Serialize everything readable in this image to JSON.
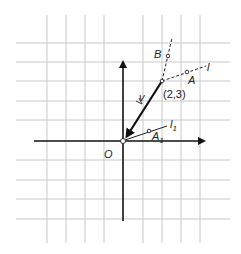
{
  "diagram": {
    "title": "",
    "labels": {
      "origin": "O",
      "point_23": "(2,3)",
      "point_B": "B",
      "point_A": "A",
      "line_l": "l",
      "line_l1_main": "l",
      "line_l1_sub": "1",
      "point_A1_main": "A",
      "point_A1_sub": "1",
      "vector_v": "v"
    },
    "grid": {
      "unit_px": 19.5,
      "origin_px": [
        123,
        141
      ],
      "x_lines_px": [
        47,
        66,
        85,
        104,
        123,
        143,
        162,
        181,
        200,
        220
      ],
      "y_lines_px": [
        43,
        62,
        81,
        101,
        120,
        141,
        160,
        180,
        199,
        219
      ],
      "line_color": "#c8c8c8"
    },
    "elements": [
      {
        "type": "axis",
        "name": "x-axis",
        "from": [
          -4.5,
          0
        ],
        "to": [
          4.3,
          0
        ]
      },
      {
        "type": "axis",
        "name": "y-axis",
        "from": [
          0,
          -4.1
        ],
        "to": [
          0,
          4.1
        ]
      },
      {
        "type": "vector",
        "name": "v",
        "from": [
          2,
          3
        ],
        "to": [
          0,
          0
        ]
      },
      {
        "type": "dashed-line",
        "name": "l",
        "through": [
          2,
          3
        ],
        "direction": [
          3,
          1
        ]
      },
      {
        "type": "dashed-line",
        "name": "perpendicular-through-B",
        "through": [
          2,
          3
        ],
        "direction": [
          1,
          3
        ]
      },
      {
        "type": "line",
        "name": "l1",
        "through": [
          0,
          0
        ],
        "direction": [
          3,
          1
        ]
      },
      {
        "type": "point",
        "name": "A",
        "coords": [
          3.3,
          3.4
        ]
      },
      {
        "type": "point",
        "name": "B",
        "coords": [
          2.3,
          4.0
        ]
      },
      {
        "type": "point",
        "name": "A1",
        "coords": [
          1.3,
          0.45
        ]
      },
      {
        "type": "point",
        "name": "(2,3)",
        "coords": [
          2,
          3
        ]
      }
    ]
  }
}
